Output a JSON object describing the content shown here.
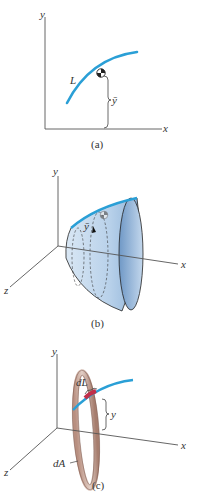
{
  "figures": [
    {
      "id": "a",
      "caption": "(a)",
      "labels": {
        "y_axis": "y",
        "x_axis": "x",
        "curve": "L",
        "centroid_height": "ȳ"
      }
    },
    {
      "id": "b",
      "caption": "(b)",
      "labels": {
        "y_axis": "y",
        "x_axis": "x",
        "z_axis": "z",
        "centroid_height": "ȳ"
      }
    },
    {
      "id": "c",
      "caption": "(c)",
      "labels": {
        "y_axis": "y",
        "x_axis": "x",
        "z_axis": "z",
        "line_element": "dL",
        "area_element": "dA",
        "distance": "y"
      }
    }
  ],
  "colors": {
    "curve": "#2a9fd6",
    "surface": "#a9c8e6",
    "ring": "#c9a79a",
    "ring_highlight": "#c0304a",
    "axis": "#555555"
  }
}
